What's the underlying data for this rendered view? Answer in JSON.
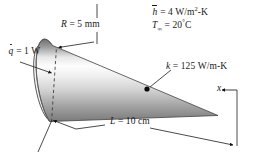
{
  "figure": {
    "kind": "engineering-schematic",
    "background_color": "#ffffff",
    "ink_color": "#1a1a1a",
    "body": {
      "shape": "cone",
      "name": "conical fin",
      "base_side": "left",
      "tip_side": "right",
      "shading": "vertical-gray-gradient",
      "gradient_stops": [
        "#6e6e6e",
        "#a8a8a8",
        "#f2f2f2",
        "#ffffff",
        "#d9d9d9",
        "#9a9a9a",
        "#767676"
      ]
    },
    "labels": {
      "convection_coefficient": {
        "symbol": "h",
        "symbol_style": "overbar",
        "equals": "=",
        "value": "4",
        "unit": "W/m",
        "unit_exponent": "2",
        "unit_tail": "-K",
        "full_text": "h = 4 W/m2-K"
      },
      "ambient_temperature": {
        "symbol": "T",
        "subscript": "∞",
        "equals": "=",
        "value": "20",
        "degree": "°",
        "unit": "C",
        "full_text": "T∞ = 20°C"
      },
      "thermal_conductivity": {
        "symbol": "k",
        "equals": "=",
        "value": "125",
        "unit": "W/m-K",
        "full_text": "k = 125 W/m-K"
      },
      "base_radius": {
        "symbol": "R",
        "equals": "=",
        "value": "5",
        "unit": "mm",
        "full_text": "R = 5 mm"
      },
      "heat_rate": {
        "symbol": "q",
        "symbol_style": "overdot",
        "equals": "=",
        "value": "1",
        "unit": "W",
        "full_text": "q = 1 W"
      },
      "length": {
        "symbol": "L",
        "equals": "=",
        "value": "10",
        "unit": "cm",
        "full_text": "L = 10 cm"
      },
      "axis": {
        "symbol": "x",
        "full_text": "x",
        "direction": "leftward-arrow"
      }
    },
    "annotations": {
      "radius_dashed_line": "dashed vertical radius on base ellipse",
      "interior_dot": "material point marker inside cone",
      "length_dimension": "dimension line spanning cone length L",
      "x_origin": "x measured from cone tip toward base"
    }
  }
}
